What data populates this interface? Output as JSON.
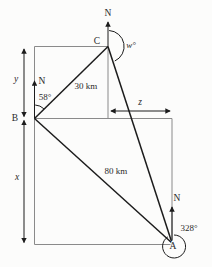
{
  "diagram": {
    "colors": {
      "line": "#1c1c1c",
      "frame": "#8a8a8a",
      "text": "#2a2a2a",
      "background": "#fcfcfb"
    },
    "points": {
      "a": "A",
      "b": "B",
      "c": "C"
    },
    "north_marks": {
      "at_c": "N",
      "at_b": "N",
      "at_a": "N"
    },
    "angles": {
      "at_b": "58°",
      "at_a": "328°",
      "at_c": "w°"
    },
    "distances": {
      "b_to_c": "30 km",
      "b_to_a": "80 km"
    },
    "dimensions": {
      "vertical_upper": "y",
      "vertical_lower": "x",
      "horizontal": "z"
    }
  }
}
